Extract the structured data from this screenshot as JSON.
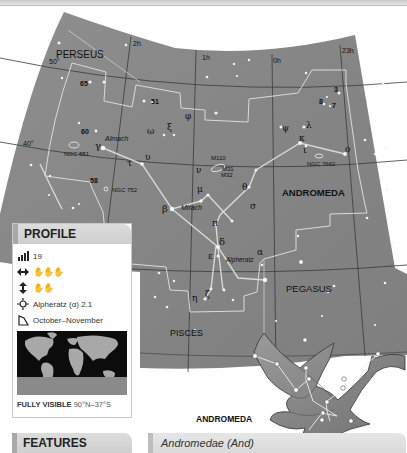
{
  "map": {
    "constellations": {
      "perseus": "PERSEUS",
      "andromeda": "ANDROMEDA",
      "pegasus": "PEGASUS",
      "pisces": "PISCES"
    },
    "ra_labels": {
      "h2": "2h",
      "h1": "1h",
      "h0": "0h",
      "h23": "23h"
    },
    "dec_labels": {
      "d50": "50°",
      "d40": "40°"
    },
    "flamsteed": {
      "n65": "65",
      "n51": "51",
      "n60": "60",
      "n58": "58",
      "n3": "3",
      "n8": "8",
      "n7": "7"
    },
    "star_names": {
      "almach": "Almach",
      "mirach": "Mirach",
      "alpheratz": "Alpheratz"
    },
    "deep_sky": {
      "ngc881": "NGC 881",
      "ngc752": "NGC 752",
      "ngc7662": "NGC 7662",
      "m110": "M110",
      "m31": "M31",
      "m32": "M32"
    },
    "greek": {
      "gamma": "γ",
      "omega": "ω",
      "xi": "ξ",
      "phi": "φ",
      "upsilon": "υ",
      "tau": "τ",
      "nu": "ν",
      "mu": "μ",
      "beta": "β",
      "pi": "π",
      "delta": "δ",
      "epsilon": "ε",
      "theta": "θ",
      "sigma": "σ",
      "zeta": "ζ",
      "eta": "η",
      "alpha": "α",
      "psi": "ψ",
      "lambda": "λ",
      "kappa": "κ",
      "iota": "ι",
      "omicron": "ο"
    }
  },
  "figure": {
    "label": "ANDROMEDA"
  },
  "profile": {
    "title": "PROFILE",
    "rows": [
      {
        "icon": "brightness-bars-icon",
        "text": "19"
      },
      {
        "icon": "width-arrows-icon",
        "text": "✋✋✋"
      },
      {
        "icon": "height-arrows-icon",
        "text": "✋✋"
      },
      {
        "icon": "brightest-star-icon",
        "text": "Alpheratz (α) 2.1"
      },
      {
        "icon": "season-corner-icon",
        "text": "October–November"
      }
    ],
    "visibility_label": "FULLY VISIBLE",
    "visibility_range": "90°N–37°S"
  },
  "features": {
    "title": "FEATURES"
  },
  "latin_name": "Andromedae (And)"
}
